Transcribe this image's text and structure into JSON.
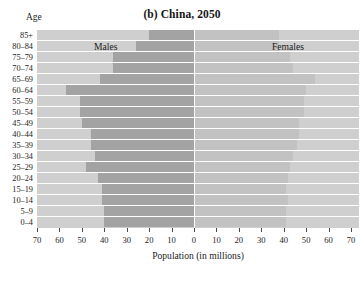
{
  "title": "(b) China, 2050",
  "axis_corner_label": "Age",
  "xlabel": "Population (in millions)",
  "series_labels": {
    "male": "Males",
    "female": "Females"
  },
  "colors": {
    "panel_background": "#cfcfcf",
    "male_bar": "#a3a3a3",
    "female_bar": "#c2c2c2",
    "gridline": "#ffffff",
    "text": "#242424"
  },
  "x_tick_labels": [
    "70",
    "60",
    "50",
    "40",
    "30",
    "20",
    "10",
    "0",
    "10",
    "20",
    "30",
    "40",
    "50",
    "60",
    "70"
  ],
  "chart_data": {
    "type": "bar",
    "subtype": "population-pyramid",
    "title": "(b) China, 2050",
    "xlabel": "Population (in millions)",
    "ylabel": "Age",
    "xlim": [
      -70,
      70
    ],
    "xticks": [
      -70,
      -60,
      -50,
      -40,
      -30,
      -20,
      -10,
      0,
      10,
      20,
      30,
      40,
      50,
      60,
      70
    ],
    "grid": true,
    "legend_position": "in-plot",
    "categories": [
      "85+",
      "80-84",
      "75-79",
      "70-74",
      "65-69",
      "60-64",
      "55-59",
      "50-54",
      "45-49",
      "40-44",
      "35-39",
      "30-34",
      "25-29",
      "20-24",
      "15-19",
      "10-14",
      "5-9",
      "0-4"
    ],
    "series": [
      {
        "name": "Males",
        "side": "left",
        "values": [
          20,
          26,
          36,
          36,
          42,
          57,
          51,
          51,
          50,
          46,
          46,
          44,
          48,
          43,
          41,
          41,
          40,
          40
        ]
      },
      {
        "name": "Females",
        "side": "right",
        "values": [
          38,
          38,
          43,
          44,
          54,
          50,
          49,
          49,
          47,
          47,
          46,
          44,
          43,
          42,
          41,
          42,
          41,
          41
        ]
      }
    ]
  }
}
